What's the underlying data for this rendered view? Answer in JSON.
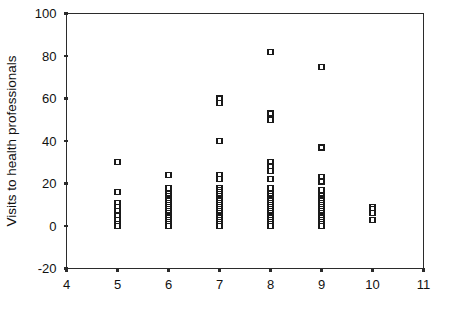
{
  "chart_data": {
    "type": "scatter",
    "title": "",
    "xlabel": "",
    "ylabel": "Visits to health professionals",
    "xlim": [
      4,
      11
    ],
    "ylim": [
      -20,
      100
    ],
    "xticks": [
      4,
      5,
      6,
      7,
      8,
      9,
      10,
      11
    ],
    "xtick_labels": [
      "4",
      "5",
      "6",
      "7",
      "8",
      "9",
      "10",
      "11"
    ],
    "yticks": [
      -20,
      0,
      20,
      40,
      60,
      80,
      100
    ],
    "ytick_labels": [
      "-20",
      "0",
      "20",
      "40",
      "60",
      "80",
      "100"
    ],
    "grid": false,
    "legend": null,
    "marker": "open-square",
    "marker_color": "#1a1a1a",
    "series": [
      {
        "name": "observations",
        "points": [
          [
            5,
            30
          ],
          [
            5,
            16
          ],
          [
            5,
            11
          ],
          [
            5,
            9
          ],
          [
            5,
            7
          ],
          [
            5,
            5
          ],
          [
            5,
            3
          ],
          [
            5,
            1
          ],
          [
            5,
            0
          ],
          [
            6,
            24
          ],
          [
            6,
            18
          ],
          [
            6,
            15
          ],
          [
            6,
            14
          ],
          [
            6,
            13
          ],
          [
            6,
            12
          ],
          [
            6,
            11
          ],
          [
            6,
            10
          ],
          [
            6,
            9
          ],
          [
            6,
            8
          ],
          [
            6,
            7
          ],
          [
            6,
            6
          ],
          [
            6,
            5
          ],
          [
            6,
            4
          ],
          [
            6,
            3
          ],
          [
            6,
            2
          ],
          [
            6,
            1
          ],
          [
            6,
            0
          ],
          [
            7,
            60
          ],
          [
            7,
            58
          ],
          [
            7,
            40
          ],
          [
            7,
            24
          ],
          [
            7,
            22
          ],
          [
            7,
            18
          ],
          [
            7,
            17
          ],
          [
            7,
            16
          ],
          [
            7,
            15
          ],
          [
            7,
            14
          ],
          [
            7,
            13
          ],
          [
            7,
            12
          ],
          [
            7,
            11
          ],
          [
            7,
            10
          ],
          [
            7,
            9
          ],
          [
            7,
            8
          ],
          [
            7,
            7
          ],
          [
            7,
            6
          ],
          [
            7,
            5
          ],
          [
            7,
            4
          ],
          [
            7,
            3
          ],
          [
            7,
            2
          ],
          [
            7,
            1
          ],
          [
            7,
            0
          ],
          [
            8,
            82
          ],
          [
            8,
            53
          ],
          [
            8,
            50
          ],
          [
            8,
            30
          ],
          [
            8,
            28
          ],
          [
            8,
            26
          ],
          [
            8,
            22
          ],
          [
            8,
            18
          ],
          [
            8,
            15
          ],
          [
            8,
            14
          ],
          [
            8,
            13
          ],
          [
            8,
            12
          ],
          [
            8,
            11
          ],
          [
            8,
            10
          ],
          [
            8,
            9
          ],
          [
            8,
            8
          ],
          [
            8,
            7
          ],
          [
            8,
            6
          ],
          [
            8,
            5
          ],
          [
            8,
            4
          ],
          [
            8,
            3
          ],
          [
            8,
            2
          ],
          [
            8,
            1
          ],
          [
            8,
            0
          ],
          [
            9,
            75
          ],
          [
            9,
            37
          ],
          [
            9,
            23
          ],
          [
            9,
            21
          ],
          [
            9,
            17
          ],
          [
            9,
            14
          ],
          [
            9,
            13
          ],
          [
            9,
            12
          ],
          [
            9,
            11
          ],
          [
            9,
            10
          ],
          [
            9,
            9
          ],
          [
            9,
            8
          ],
          [
            9,
            7
          ],
          [
            9,
            6
          ],
          [
            9,
            5
          ],
          [
            9,
            4
          ],
          [
            9,
            3
          ],
          [
            9,
            2
          ],
          [
            9,
            1
          ],
          [
            9,
            0
          ],
          [
            10,
            9
          ],
          [
            10,
            8
          ],
          [
            10,
            6
          ],
          [
            10,
            3
          ]
        ]
      }
    ]
  }
}
